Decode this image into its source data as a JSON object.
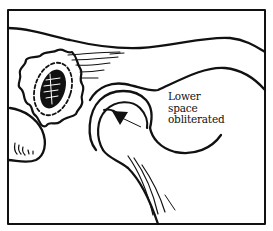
{
  "figure": {
    "type": "line-drawing",
    "colors": {
      "ink": "#111111",
      "background": "#ffffff"
    },
    "annotation": {
      "lines": [
        "Lower",
        "space",
        "obliterated"
      ],
      "pointer": "arrow"
    }
  }
}
